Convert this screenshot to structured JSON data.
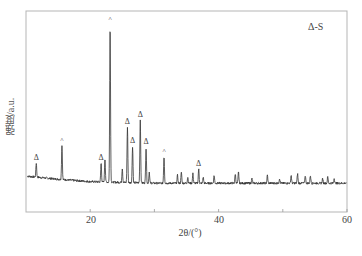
{
  "chart_data": {
    "type": "line",
    "title": "",
    "xlabel": "2θ/(°)",
    "ylabel": "强度/a.u.",
    "xlim": [
      10,
      60
    ],
    "ylim": [
      0,
      110
    ],
    "x_ticks": [
      20,
      40,
      60
    ],
    "x_minor_ticks": [
      30,
      50
    ],
    "y_ticks": [],
    "grid": false,
    "legend": {
      "position": "top-right",
      "entries": [
        "Δ-S"
      ]
    },
    "series": [
      {
        "name": "XRD pattern",
        "color": "#333333",
        "peaks": [
          {
            "two_theta": 11.6,
            "intensity": 9,
            "marker": "Δ"
          },
          {
            "two_theta": 15.6,
            "intensity": 22,
            "marker": "^"
          },
          {
            "two_theta": 21.7,
            "intensity": 12,
            "marker": "Δ"
          },
          {
            "two_theta": 22.3,
            "intensity": 15,
            "marker": ""
          },
          {
            "two_theta": 23.1,
            "intensity": 100,
            "marker": "^"
          },
          {
            "two_theta": 25.0,
            "intensity": 9,
            "marker": ""
          },
          {
            "two_theta": 25.8,
            "intensity": 35,
            "marker": "Δ"
          },
          {
            "two_theta": 26.6,
            "intensity": 23,
            "marker": "Δ"
          },
          {
            "two_theta": 27.8,
            "intensity": 40,
            "marker": "Δ"
          },
          {
            "two_theta": 28.7,
            "intensity": 23,
            "marker": "Δ"
          },
          {
            "two_theta": 29.2,
            "intensity": 7,
            "marker": ""
          },
          {
            "two_theta": 31.5,
            "intensity": 17,
            "marker": "^"
          },
          {
            "two_theta": 33.6,
            "intensity": 5,
            "marker": ""
          },
          {
            "two_theta": 34.2,
            "intensity": 7,
            "marker": ""
          },
          {
            "two_theta": 35.2,
            "intensity": 4,
            "marker": ""
          },
          {
            "two_theta": 36.0,
            "intensity": 6,
            "marker": ""
          },
          {
            "two_theta": 36.9,
            "intensity": 9,
            "marker": "Δ"
          },
          {
            "two_theta": 37.6,
            "intensity": 4,
            "marker": ""
          },
          {
            "two_theta": 39.3,
            "intensity": 5,
            "marker": ""
          },
          {
            "two_theta": 42.6,
            "intensity": 6,
            "marker": ""
          },
          {
            "two_theta": 43.1,
            "intensity": 7,
            "marker": ""
          },
          {
            "two_theta": 45.2,
            "intensity": 3,
            "marker": ""
          },
          {
            "two_theta": 47.6,
            "intensity": 5,
            "marker": ""
          },
          {
            "two_theta": 49.5,
            "intensity": 3,
            "marker": ""
          },
          {
            "two_theta": 51.3,
            "intensity": 5,
            "marker": ""
          },
          {
            "two_theta": 52.3,
            "intensity": 6,
            "marker": ""
          },
          {
            "two_theta": 53.5,
            "intensity": 5,
            "marker": ""
          },
          {
            "two_theta": 54.3,
            "intensity": 5,
            "marker": ""
          },
          {
            "two_theta": 56.2,
            "intensity": 3,
            "marker": ""
          },
          {
            "two_theta": 57.0,
            "intensity": 4,
            "marker": ""
          },
          {
            "two_theta": 58.0,
            "intensity": 3,
            "marker": ""
          }
        ],
        "baseline": [
          {
            "two_theta": 10.0,
            "intensity": 5
          },
          {
            "two_theta": 15.0,
            "intensity": 3
          },
          {
            "two_theta": 20.0,
            "intensity": 1.5
          },
          {
            "two_theta": 30.0,
            "intensity": 0.5
          },
          {
            "two_theta": 40.0,
            "intensity": 0.5
          },
          {
            "two_theta": 60.0,
            "intensity": 0.5
          }
        ]
      }
    ],
    "annotations": [
      "Δ",
      "^"
    ]
  },
  "labels": {
    "xlabel": "2θ/(°)",
    "ylabel": "强度/a.u.",
    "legend": "Δ-S",
    "ticks": [
      "20",
      "40",
      "60"
    ]
  }
}
